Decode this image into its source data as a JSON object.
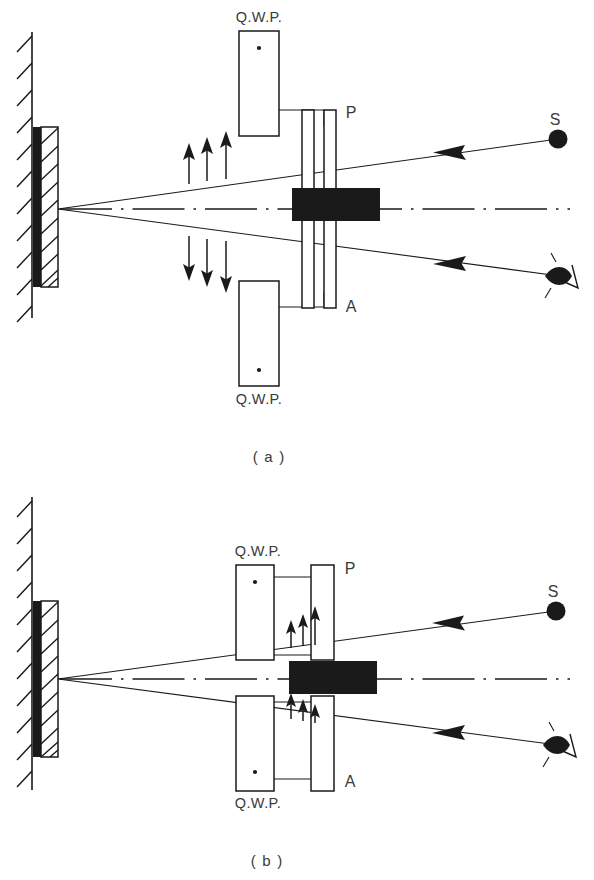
{
  "figure": {
    "title_visible": false,
    "panels": [
      {
        "id": "a",
        "caption": "( a )",
        "labels": {
          "qwp_top": "Q.W.P.",
          "qwp_bottom": "Q.W.P.",
          "polarizer": "P",
          "analyzer": "A",
          "source": "S"
        },
        "elements": {
          "wall": "hatched-wall",
          "mirror": "front-silvered-mirror",
          "sample": "black-specimen-block",
          "axis": "dash-dot-optical-axis",
          "detector": "eye",
          "polarization_top": "long-up-arrows",
          "polarization_bottom": "long-down-arrows",
          "arrow_count_top": 3,
          "arrow_count_bottom": 3
        }
      },
      {
        "id": "b",
        "caption": "( b )",
        "labels": {
          "qwp_top": "Q.W.P.",
          "qwp_bottom": "Q.W.P.",
          "polarizer": "P",
          "analyzer": "A",
          "source": "S"
        },
        "elements": {
          "wall": "hatched-wall",
          "mirror": "front-silvered-mirror",
          "sample": "black-specimen-block",
          "axis": "dash-dot-optical-axis",
          "detector": "eye",
          "polarization_top": "short-up-arrows",
          "polarization_bottom": "short-up-arrows",
          "arrow_count_top": 3,
          "arrow_count_bottom": 3
        }
      }
    ],
    "colors": {
      "ink": "#1a1a1a",
      "text": "#3a3a3a",
      "background": "#ffffff"
    }
  }
}
